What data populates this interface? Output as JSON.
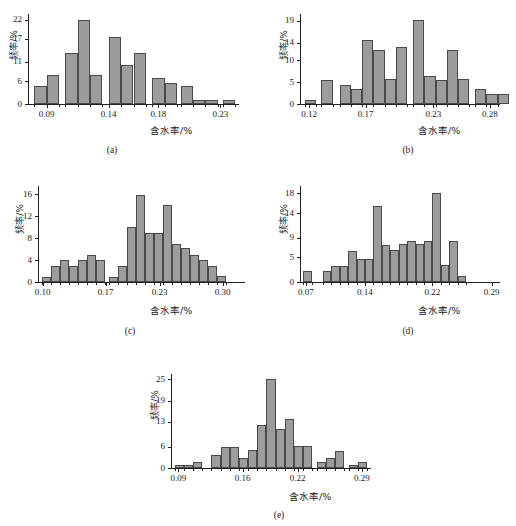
{
  "figure": {
    "width": 516,
    "height": 526,
    "background": "#ffffff",
    "bar_fill": "#9c9c9c",
    "bar_stroke": "#4a4a4a",
    "axis_color": "#222222"
  },
  "chart_data": [
    {
      "id": "a",
      "type": "bar",
      "title": "",
      "caption": "(a)",
      "xlabel": "含水率/%",
      "ylabel": "频率/%",
      "xlim": [
        0.075,
        0.245
      ],
      "ylim": [
        0,
        23.5
      ],
      "ytick_labels": [
        "0",
        "6",
        "11",
        "17",
        "22"
      ],
      "ytick_values": [
        0,
        6,
        11,
        17,
        22
      ],
      "xtick_labels": [
        "0.09",
        "0.14",
        "0.18",
        "0.23"
      ],
      "xtick_values": [
        0.09,
        0.14,
        0.18,
        0.23
      ],
      "bin_width": 0.01,
      "bins": [
        {
          "x0": 0.08,
          "x1": 0.09,
          "value": 4.6
        },
        {
          "x0": 0.09,
          "x1": 0.1,
          "value": 7.7
        },
        {
          "x0": 0.105,
          "x1": 0.115,
          "value": 13.2
        },
        {
          "x0": 0.115,
          "x1": 0.125,
          "value": 22.0
        },
        {
          "x0": 0.125,
          "x1": 0.135,
          "value": 7.7
        },
        {
          "x0": 0.14,
          "x1": 0.15,
          "value": 17.5
        },
        {
          "x0": 0.15,
          "x1": 0.16,
          "value": 10.2
        },
        {
          "x0": 0.16,
          "x1": 0.17,
          "value": 13.2
        },
        {
          "x0": 0.175,
          "x1": 0.185,
          "value": 6.7
        },
        {
          "x0": 0.185,
          "x1": 0.195,
          "value": 5.6
        },
        {
          "x0": 0.198,
          "x1": 0.208,
          "value": 4.6
        },
        {
          "x0": 0.208,
          "x1": 0.218,
          "value": 1.1
        },
        {
          "x0": 0.218,
          "x1": 0.228,
          "value": 1.1
        },
        {
          "x0": 0.232,
          "x1": 0.242,
          "value": 1.1
        }
      ]
    },
    {
      "id": "b",
      "type": "bar",
      "title": "",
      "caption": "(b)",
      "xlabel": "含水率/%",
      "ylabel": "频率/%",
      "xlim": [
        0.112,
        0.289
      ],
      "ylim": [
        0,
        20.5
      ],
      "ytick_labels": [
        "0",
        "5",
        "10",
        "14",
        "19"
      ],
      "ytick_values": [
        0,
        5,
        10,
        14,
        19
      ],
      "xtick_labels": [
        "0.12",
        "0.17",
        "0.23",
        "0.28"
      ],
      "xtick_values": [
        0.12,
        0.17,
        0.23,
        0.28
      ],
      "bin_width": 0.01,
      "bins": [
        {
          "x0": 0.116,
          "x1": 0.126,
          "value": 1.0
        },
        {
          "x0": 0.131,
          "x1": 0.141,
          "value": 5.5
        },
        {
          "x0": 0.147,
          "x1": 0.157,
          "value": 4.3
        },
        {
          "x0": 0.157,
          "x1": 0.167,
          "value": 3.4
        },
        {
          "x0": 0.167,
          "x1": 0.177,
          "value": 14.5
        },
        {
          "x0": 0.177,
          "x1": 0.187,
          "value": 12.2
        },
        {
          "x0": 0.187,
          "x1": 0.197,
          "value": 5.6
        },
        {
          "x0": 0.197,
          "x1": 0.207,
          "value": 12.9
        },
        {
          "x0": 0.212,
          "x1": 0.222,
          "value": 19.1
        },
        {
          "x0": 0.222,
          "x1": 0.232,
          "value": 6.3
        },
        {
          "x0": 0.232,
          "x1": 0.242,
          "value": 5.5
        },
        {
          "x0": 0.242,
          "x1": 0.252,
          "value": 12.2
        },
        {
          "x0": 0.252,
          "x1": 0.262,
          "value": 5.6
        },
        {
          "x0": 0.267,
          "x1": 0.277,
          "value": 3.5
        },
        {
          "x0": 0.277,
          "x1": 0.287,
          "value": 2.2
        },
        {
          "x0": 0.287,
          "x1": 0.297,
          "value": 2.2
        }
      ]
    },
    {
      "id": "c",
      "type": "bar",
      "title": "",
      "caption": "(c)",
      "xlabel": "含水率/%",
      "ylabel": "频率/%",
      "xlim": [
        0.095,
        0.325
      ],
      "ylim": [
        0,
        17.5
      ],
      "ytick_labels": [
        "0",
        "4",
        "8",
        "12",
        "16"
      ],
      "ytick_values": [
        0,
        4,
        8,
        12,
        16
      ],
      "xtick_labels": [
        "0.10",
        "0.17",
        "0.23",
        "0.30"
      ],
      "xtick_values": [
        0.1,
        0.17,
        0.23,
        0.3
      ],
      "bin_width": 0.01,
      "bins": [
        {
          "x0": 0.099,
          "x1": 0.109,
          "value": 1.0
        },
        {
          "x0": 0.109,
          "x1": 0.119,
          "value": 3.0
        },
        {
          "x0": 0.119,
          "x1": 0.129,
          "value": 4.0
        },
        {
          "x0": 0.129,
          "x1": 0.139,
          "value": 3.0
        },
        {
          "x0": 0.139,
          "x1": 0.149,
          "value": 4.1
        },
        {
          "x0": 0.149,
          "x1": 0.159,
          "value": 5.0
        },
        {
          "x0": 0.159,
          "x1": 0.169,
          "value": 4.0
        },
        {
          "x0": 0.174,
          "x1": 0.184,
          "value": 1.0
        },
        {
          "x0": 0.184,
          "x1": 0.194,
          "value": 3.0
        },
        {
          "x0": 0.194,
          "x1": 0.204,
          "value": 10.0
        },
        {
          "x0": 0.204,
          "x1": 0.214,
          "value": 15.9
        },
        {
          "x0": 0.214,
          "x1": 0.224,
          "value": 9.0
        },
        {
          "x0": 0.224,
          "x1": 0.234,
          "value": 9.0
        },
        {
          "x0": 0.234,
          "x1": 0.244,
          "value": 14.1
        },
        {
          "x0": 0.244,
          "x1": 0.254,
          "value": 7.0
        },
        {
          "x0": 0.254,
          "x1": 0.264,
          "value": 6.2
        },
        {
          "x0": 0.264,
          "x1": 0.274,
          "value": 5.0
        },
        {
          "x0": 0.274,
          "x1": 0.284,
          "value": 4.0
        },
        {
          "x0": 0.284,
          "x1": 0.294,
          "value": 3.0
        },
        {
          "x0": 0.294,
          "x1": 0.304,
          "value": 1.1
        }
      ]
    },
    {
      "id": "d",
      "type": "bar",
      "title": "",
      "caption": "(d)",
      "xlabel": "含水率/%",
      "ylabel": "频率/%",
      "xlim": [
        0.063,
        0.3
      ],
      "ylim": [
        0,
        19.5
      ],
      "ytick_labels": [
        "0",
        "5",
        "9",
        "14",
        "18"
      ],
      "ytick_values": [
        0,
        5,
        9,
        14,
        18
      ],
      "xtick_labels": [
        "0.07",
        "0.14",
        "0.22",
        "0.29"
      ],
      "xtick_values": [
        0.07,
        0.14,
        0.22,
        0.29
      ],
      "bin_width": 0.01,
      "bins": [
        {
          "x0": 0.067,
          "x1": 0.077,
          "value": 2.2
        },
        {
          "x0": 0.09,
          "x1": 0.1,
          "value": 2.2
        },
        {
          "x0": 0.1,
          "x1": 0.11,
          "value": 3.3
        },
        {
          "x0": 0.11,
          "x1": 0.12,
          "value": 3.3
        },
        {
          "x0": 0.12,
          "x1": 0.13,
          "value": 6.3
        },
        {
          "x0": 0.13,
          "x1": 0.14,
          "value": 4.6
        },
        {
          "x0": 0.14,
          "x1": 0.15,
          "value": 4.6
        },
        {
          "x0": 0.15,
          "x1": 0.16,
          "value": 15.4
        },
        {
          "x0": 0.16,
          "x1": 0.17,
          "value": 7.6
        },
        {
          "x0": 0.17,
          "x1": 0.18,
          "value": 6.4
        },
        {
          "x0": 0.18,
          "x1": 0.19,
          "value": 7.7
        },
        {
          "x0": 0.19,
          "x1": 0.2,
          "value": 8.4
        },
        {
          "x0": 0.2,
          "x1": 0.21,
          "value": 7.8
        },
        {
          "x0": 0.21,
          "x1": 0.22,
          "value": 8.4
        },
        {
          "x0": 0.22,
          "x1": 0.23,
          "value": 18.1
        },
        {
          "x0": 0.23,
          "x1": 0.24,
          "value": 3.4
        },
        {
          "x0": 0.24,
          "x1": 0.25,
          "value": 8.3
        },
        {
          "x0": 0.25,
          "x1": 0.26,
          "value": 1.2
        }
      ]
    },
    {
      "id": "e",
      "type": "bar",
      "title": "",
      "caption": "(e)",
      "xlabel": "含水率/%",
      "ylabel": "频率/%",
      "xlim": [
        0.082,
        0.3
      ],
      "ylim": [
        0,
        26.5
      ],
      "ytick_labels": [
        "0",
        "6",
        "13",
        "19",
        "25"
      ],
      "ytick_values": [
        0,
        6,
        13,
        19,
        25
      ],
      "xtick_labels": [
        "0.09",
        "0.16",
        "0.22",
        "0.29"
      ],
      "xtick_values": [
        0.09,
        0.16,
        0.22,
        0.29
      ],
      "bin_width": 0.01,
      "bins": [
        {
          "x0": 0.086,
          "x1": 0.096,
          "value": 0.9
        },
        {
          "x0": 0.096,
          "x1": 0.106,
          "value": 0.9
        },
        {
          "x0": 0.106,
          "x1": 0.116,
          "value": 1.7
        },
        {
          "x0": 0.126,
          "x1": 0.136,
          "value": 3.6
        },
        {
          "x0": 0.136,
          "x1": 0.146,
          "value": 6.0
        },
        {
          "x0": 0.146,
          "x1": 0.156,
          "value": 6.0
        },
        {
          "x0": 0.156,
          "x1": 0.166,
          "value": 2.8
        },
        {
          "x0": 0.166,
          "x1": 0.176,
          "value": 5.0
        },
        {
          "x0": 0.176,
          "x1": 0.186,
          "value": 12.0
        },
        {
          "x0": 0.186,
          "x1": 0.196,
          "value": 25.1
        },
        {
          "x0": 0.196,
          "x1": 0.206,
          "value": 11.0
        },
        {
          "x0": 0.206,
          "x1": 0.216,
          "value": 13.9
        },
        {
          "x0": 0.216,
          "x1": 0.226,
          "value": 6.2
        },
        {
          "x0": 0.226,
          "x1": 0.236,
          "value": 6.2
        },
        {
          "x0": 0.241,
          "x1": 0.251,
          "value": 1.8
        },
        {
          "x0": 0.251,
          "x1": 0.261,
          "value": 2.8
        },
        {
          "x0": 0.261,
          "x1": 0.271,
          "value": 4.8
        },
        {
          "x0": 0.276,
          "x1": 0.286,
          "value": 0.8
        },
        {
          "x0": 0.286,
          "x1": 0.296,
          "value": 1.7
        }
      ]
    }
  ],
  "panels": {
    "a": {
      "left": 0,
      "top": 0,
      "width": 258,
      "height": 163,
      "plot": {
        "left": 28,
        "top": 14,
        "width": 211,
        "height": 90
      },
      "ylabel_x": 6,
      "ylabel_y": 40,
      "xlabel_x": 150,
      "xlabel_y": 126,
      "caption_x": 112,
      "caption_y": 145
    },
    "b": {
      "left": 258,
      "top": 0,
      "width": 258,
      "height": 163,
      "plot": {
        "left": 42,
        "top": 14,
        "width": 200,
        "height": 90
      },
      "ylabel_x": 18,
      "ylabel_y": 40,
      "xlabel_x": 160,
      "xlabel_y": 126,
      "caption_x": 150,
      "caption_y": 145
    },
    "c": {
      "left": 0,
      "top": 170,
      "width": 258,
      "height": 175,
      "plot": {
        "left": 38,
        "top": 16,
        "width": 207,
        "height": 96
      },
      "ylabel_x": 12,
      "ylabel_y": 44,
      "xlabel_x": 150,
      "xlabel_y": 136,
      "caption_x": 130,
      "caption_y": 156
    },
    "d": {
      "left": 258,
      "top": 170,
      "width": 258,
      "height": 175,
      "plot": {
        "left": 42,
        "top": 16,
        "width": 200,
        "height": 96
      },
      "ylabel_x": 18,
      "ylabel_y": 44,
      "xlabel_x": 160,
      "xlabel_y": 136,
      "caption_x": 150,
      "caption_y": 156
    },
    "e": {
      "left": 129,
      "top": 358,
      "width": 258,
      "height": 168,
      "plot": {
        "left": 42,
        "top": 16,
        "width": 200,
        "height": 94
      },
      "ylabel_x": 18,
      "ylabel_y": 42,
      "xlabel_x": 160,
      "xlabel_y": 134,
      "caption_x": 150,
      "caption_y": 152
    }
  }
}
